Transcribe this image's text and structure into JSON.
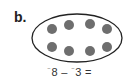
{
  "problem": {
    "label": "b.",
    "set": {
      "shape": "ellipse",
      "dot_count": 8,
      "dot_color": "#6e6e6e",
      "outline_color": "#222222",
      "dots": [
        {
          "cx": 52,
          "cy": 29
        },
        {
          "cx": 69,
          "cy": 25
        },
        {
          "cx": 90,
          "cy": 24
        },
        {
          "cx": 107,
          "cy": 29
        },
        {
          "cx": 52,
          "cy": 47
        },
        {
          "cx": 69,
          "cy": 51
        },
        {
          "cx": 90,
          "cy": 51
        },
        {
          "cx": 107,
          "cy": 47
        }
      ]
    },
    "expression": {
      "neg1": "⁻",
      "a": "8",
      "op": " – ",
      "neg2": "⁻",
      "b": "3",
      "eq": " ="
    }
  }
}
